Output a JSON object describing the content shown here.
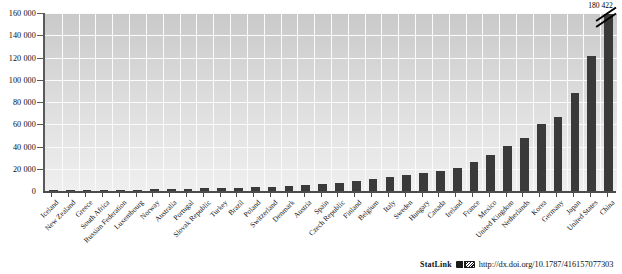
{
  "chart_data": {
    "type": "bar",
    "title": "",
    "subtitle": "",
    "xlabel": "",
    "ylabel": "",
    "ylim": [
      0,
      160000
    ],
    "ytick_values": [
      0,
      20000,
      40000,
      60000,
      80000,
      100000,
      120000,
      140000,
      160000
    ],
    "ytick_labels": [
      "0",
      "20 000",
      "40 000",
      "60 000",
      "80 000",
      "100 000",
      "120 000",
      "140 000",
      "160 000"
    ],
    "grid": true,
    "legend": "none",
    "bar_color": "#3a3a3a",
    "categories": [
      "Iceland",
      "New Zealand",
      "Greece",
      "South Africa",
      "Russian Federation",
      "Luxembourg",
      "Norway",
      "Australia",
      "Portugal",
      "Slovak Republic",
      "Turkey",
      "Brazil",
      "Poland",
      "Switzerland",
      "Denmark",
      "Austria",
      "Spain",
      "Czech Republic",
      "Finland",
      "Belgium",
      "Italy",
      "Sweden",
      "Hungary",
      "Canada",
      "Ireland",
      "France",
      "Mexico",
      "United Kingdom",
      "Netherlands",
      "Korea",
      "Germany",
      "Japan",
      "United States",
      "China"
    ],
    "values": [
      180,
      420,
      700,
      900,
      1100,
      1300,
      1600,
      1900,
      2100,
      2400,
      2700,
      3100,
      3500,
      4000,
      4600,
      5300,
      6100,
      7600,
      9200,
      11000,
      12600,
      14300,
      16000,
      17700,
      20600,
      25800,
      32500,
      40800,
      47500,
      60300,
      66500,
      88000,
      121500,
      180422
    ],
    "truncated_bar": {
      "category": "China",
      "displayed_value_label": "180 422",
      "has_axis_break": true
    }
  },
  "footer": {
    "statlink_label": "StatLink",
    "statlink_icon": "statlink-glyph-icon",
    "url": "http://dx.doi.org/10.1787/416157077303"
  }
}
